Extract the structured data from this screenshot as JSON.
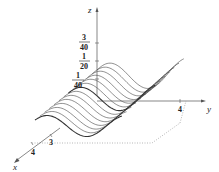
{
  "figure": {
    "type": "3d-surface-plot",
    "axes": {
      "x": {
        "label": "x",
        "ticks": [
          "3",
          "4"
        ]
      },
      "y": {
        "label": "y",
        "ticks": [
          "4"
        ]
      },
      "z": {
        "label": "z",
        "ticks": [
          {
            "num": "1",
            "den": "40"
          },
          {
            "num": "1",
            "den": "20"
          },
          {
            "num": "3",
            "den": "40"
          }
        ]
      }
    },
    "surface": {
      "style": "wireframe-curves",
      "curve_count": 14,
      "description": "Sinusoidal wave-like sheet of curves drawn along the y-direction, stacked along x"
    },
    "colors": {
      "axis": "#555555",
      "curves": "#333333",
      "base": "#999999",
      "text": "#222222"
    }
  }
}
